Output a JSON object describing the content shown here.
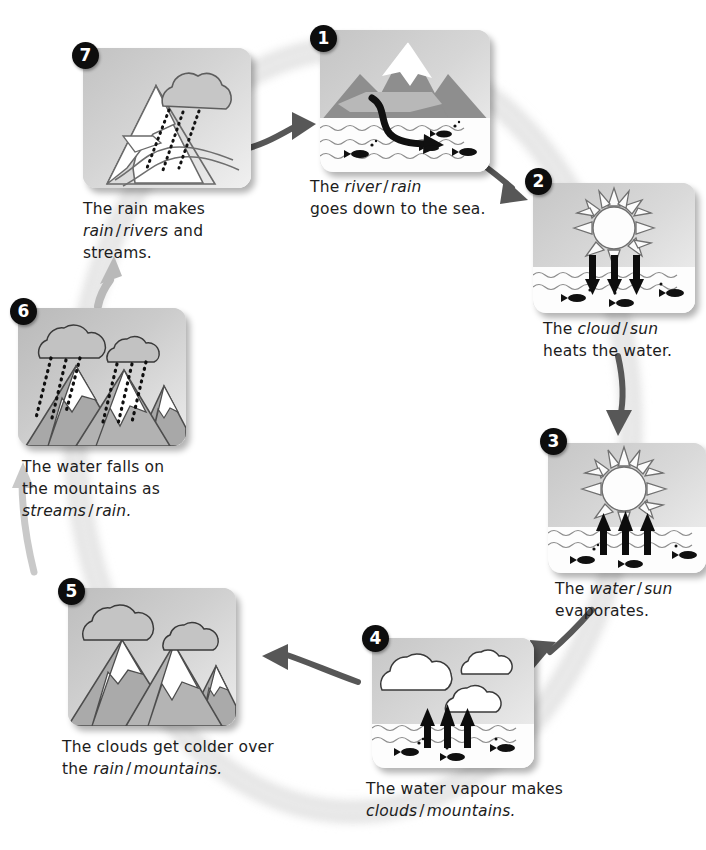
{
  "diagram": {
    "type": "cycle-diagram",
    "direction": "clockwise",
    "background_ring_color": "#e4e4e4",
    "panel_gradient": [
      "#c3c3c3",
      "#efefef"
    ],
    "badge_color": "#0d0d0d",
    "badge_text_color": "#ffffff",
    "arrow_color_dark": "#575757",
    "arrow_color_light": "#b9b9b9",
    "text_color": "#1c1c1c"
  },
  "steps": [
    {
      "number": "1",
      "badge": "1",
      "scene": "mountain-river-to-sea",
      "caption_lines": [
        {
          "parts": [
            {
              "text": "The ",
              "style": "normal"
            },
            {
              "text": "river",
              "style": "italic"
            },
            {
              "text": "/",
              "style": "slash"
            },
            {
              "text": "rain",
              "style": "italic"
            }
          ]
        },
        {
          "parts": [
            {
              "text": "goes down to the sea.",
              "style": "normal"
            }
          ]
        }
      ],
      "caption_plain": "The river / rain goes down to the sea.",
      "choices": [
        "river",
        "rain"
      ]
    },
    {
      "number": "2",
      "badge": "2",
      "scene": "sun-heats-sea-arrows-down",
      "caption_lines": [
        {
          "parts": [
            {
              "text": "The ",
              "style": "normal"
            },
            {
              "text": "cloud",
              "style": "italic"
            },
            {
              "text": "/",
              "style": "slash"
            },
            {
              "text": "sun",
              "style": "italic"
            }
          ]
        },
        {
          "parts": [
            {
              "text": "heats the water.",
              "style": "normal"
            }
          ]
        }
      ],
      "caption_plain": "The cloud / sun heats the water.",
      "choices": [
        "cloud",
        "sun"
      ]
    },
    {
      "number": "3",
      "badge": "3",
      "scene": "sun-evaporation-arrows-up",
      "caption_lines": [
        {
          "parts": [
            {
              "text": "The ",
              "style": "normal"
            },
            {
              "text": "water",
              "style": "italic"
            },
            {
              "text": "/",
              "style": "slash"
            },
            {
              "text": "sun",
              "style": "italic"
            }
          ]
        },
        {
          "parts": [
            {
              "text": "evaporates.",
              "style": "normal"
            }
          ]
        }
      ],
      "caption_plain": "The water / sun evaporates.",
      "choices": [
        "water",
        "sun"
      ]
    },
    {
      "number": "4",
      "badge": "4",
      "scene": "clouds-forming-over-sea",
      "caption_lines": [
        {
          "parts": [
            {
              "text": "The water vapour makes",
              "style": "normal"
            }
          ]
        },
        {
          "parts": [
            {
              "text": "clouds",
              "style": "italic"
            },
            {
              "text": "/",
              "style": "slash"
            },
            {
              "text": "mountains.",
              "style": "italic"
            }
          ]
        }
      ],
      "caption_plain": "The water vapour makes clouds / mountains.",
      "choices": [
        "clouds",
        "mountains"
      ]
    },
    {
      "number": "5",
      "badge": "5",
      "scene": "clouds-over-mountains",
      "caption_lines": [
        {
          "parts": [
            {
              "text": "The clouds get colder over",
              "style": "normal"
            }
          ]
        },
        {
          "parts": [
            {
              "text": "the ",
              "style": "normal"
            },
            {
              "text": "rain",
              "style": "italic"
            },
            {
              "text": "/",
              "style": "slash"
            },
            {
              "text": "mountains.",
              "style": "italic"
            }
          ]
        }
      ],
      "caption_plain": "The clouds get colder over the rain / mountains.",
      "choices": [
        "rain",
        "mountains"
      ]
    },
    {
      "number": "6",
      "badge": "6",
      "scene": "rain-falling-on-mountains",
      "caption_lines": [
        {
          "parts": [
            {
              "text": "The water falls on",
              "style": "normal"
            }
          ]
        },
        {
          "parts": [
            {
              "text": "the mountains as",
              "style": "normal"
            }
          ]
        },
        {
          "parts": [
            {
              "text": "streams",
              "style": "italic"
            },
            {
              "text": "/",
              "style": "slash"
            },
            {
              "text": "rain.",
              "style": "italic"
            }
          ]
        }
      ],
      "caption_plain": "The water falls on the mountains as streams / rain.",
      "choices": [
        "streams",
        "rain"
      ]
    },
    {
      "number": "7",
      "badge": "7",
      "scene": "rain-makes-rivers",
      "caption_lines": [
        {
          "parts": [
            {
              "text": "The rain makes",
              "style": "normal"
            }
          ]
        },
        {
          "parts": [
            {
              "text": "rain",
              "style": "italic"
            },
            {
              "text": "/",
              "style": "slash"
            },
            {
              "text": "rivers",
              "style": "italic"
            },
            {
              "text": " and",
              "style": "normal"
            }
          ]
        },
        {
          "parts": [
            {
              "text": "streams.",
              "style": "normal"
            }
          ]
        }
      ],
      "caption_plain": "The rain makes rain / rivers and streams.",
      "choices": [
        "rain",
        "rivers"
      ]
    }
  ]
}
